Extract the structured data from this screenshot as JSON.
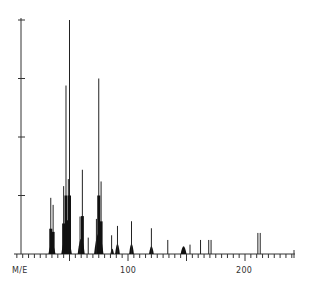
{
  "chart_data": {
    "type": "bar",
    "title": "",
    "xlabel": "M/E",
    "ylabel": "",
    "x_tick_labels": [
      "100",
      "200"
    ],
    "xlim": [
      0,
      243
    ],
    "ylim": [
      0,
      100
    ],
    "y_ticks": [
      25,
      50,
      75,
      100
    ],
    "grid": false,
    "legend": null,
    "series": [
      {
        "name": "mass spectrum",
        "peaks": [
          {
            "mz": 34,
            "intensity": 24
          },
          {
            "mz": 36,
            "intensity": 21
          },
          {
            "mz": 45,
            "intensity": 29
          },
          {
            "mz": 47,
            "intensity": 72
          },
          {
            "mz": 49,
            "intensity": 32
          },
          {
            "mz": 50,
            "intensity": 100
          },
          {
            "mz": 59,
            "intensity": 16
          },
          {
            "mz": 61,
            "intensity": 36
          },
          {
            "mz": 66,
            "intensity": 7
          },
          {
            "mz": 73,
            "intensity": 15
          },
          {
            "mz": 75,
            "intensity": 75
          },
          {
            "mz": 77,
            "intensity": 31
          },
          {
            "mz": 86,
            "intensity": 8
          },
          {
            "mz": 91,
            "intensity": 12
          },
          {
            "mz": 103,
            "intensity": 14
          },
          {
            "mz": 120,
            "intensity": 11
          },
          {
            "mz": 134,
            "intensity": 6
          },
          {
            "mz": 153,
            "intensity": 4
          },
          {
            "mz": 162,
            "intensity": 6
          },
          {
            "mz": 169,
            "intensity": 6
          },
          {
            "mz": 171,
            "intensity": 6
          },
          {
            "mz": 211,
            "intensity": 9
          },
          {
            "mz": 213,
            "intensity": 9
          }
        ],
        "clusters": [
          {
            "mz_from": 32,
            "mz_to": 38,
            "base": 4
          },
          {
            "mz_from": 43,
            "mz_to": 52,
            "base": 7
          },
          {
            "mz_from": 57,
            "mz_to": 63,
            "base": 6
          },
          {
            "mz_from": 71,
            "mz_to": 79,
            "base": 8
          },
          {
            "mz_from": 85,
            "mz_to": 88,
            "base": 2
          },
          {
            "mz_from": 89,
            "mz_to": 93,
            "base": 4
          },
          {
            "mz_from": 101,
            "mz_to": 105,
            "base": 4
          },
          {
            "mz_from": 118,
            "mz_to": 122,
            "base": 3
          },
          {
            "mz_from": 145,
            "mz_to": 150,
            "base": 3
          }
        ]
      }
    ]
  },
  "axis": {
    "x_label": "M/E",
    "x_tick_100": "100",
    "x_tick_200": "200"
  }
}
